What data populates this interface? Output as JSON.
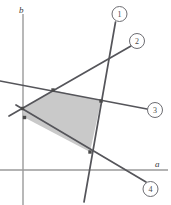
{
  "figure": {
    "type": "constraint-plot",
    "width": 171,
    "height": 205,
    "background": "#ffffff"
  },
  "axes": {
    "x_label": "a",
    "y_label": "b",
    "x_axis": {
      "y": 170,
      "x_start": 0,
      "x_end": 168,
      "color": "#9a9a9a"
    },
    "y_axis": {
      "x": 23,
      "y_start": 14,
      "y_end": 205,
      "color": "#9a9a9a"
    }
  },
  "chart_data": {
    "type": "line",
    "title": "",
    "xlabel": "a",
    "ylabel": "b",
    "grid": false,
    "legend_position": "callout-circles",
    "constraint_lines": [
      {
        "id": "1",
        "label": "1",
        "color": "#55555a",
        "x1": 84,
        "y1": 202,
        "x2": 115.5,
        "y2": 22,
        "callout": {
          "cx": 119.5,
          "cy": 14,
          "r": 7.5
        }
      },
      {
        "id": "2",
        "label": "2",
        "color": "#55555a",
        "x1": 9,
        "y1": 116,
        "x2": 131,
        "y2": 46,
        "callout": {
          "cx": 137,
          "cy": 41,
          "r": 7.5
        }
      },
      {
        "id": "3",
        "label": "3",
        "color": "#55555a",
        "x1": 0,
        "y1": 81,
        "x2": 147,
        "y2": 109,
        "callout": {
          "cx": 155,
          "cy": 110,
          "r": 7.5
        }
      },
      {
        "id": "4",
        "label": "4",
        "color": "#55555a",
        "x1": 16,
        "y1": 105,
        "x2": 146,
        "y2": 182,
        "callout": {
          "cx": 150.5,
          "cy": 189,
          "r": 7.5
        }
      }
    ],
    "feasible_region": {
      "fill": "#c9c9c9",
      "opacity": 1,
      "vertices": [
        {
          "x": 22.5,
          "y": 108.5,
          "marker": true
        },
        {
          "x": 53,
          "y": 90,
          "marker": true
        },
        {
          "x": 101,
          "y": 101,
          "marker": true
        },
        {
          "x": 90,
          "y": 152,
          "marker": true
        },
        {
          "x": 24.5,
          "y": 117.5,
          "marker": true
        }
      ]
    },
    "vertex_marker": {
      "color": "#4a4a4a",
      "size": 3.4
    }
  },
  "colors": {
    "line": "#55555a",
    "axis": "#9a9a9a",
    "shade": "#c9c9c9",
    "text": "#4a4a4a"
  }
}
